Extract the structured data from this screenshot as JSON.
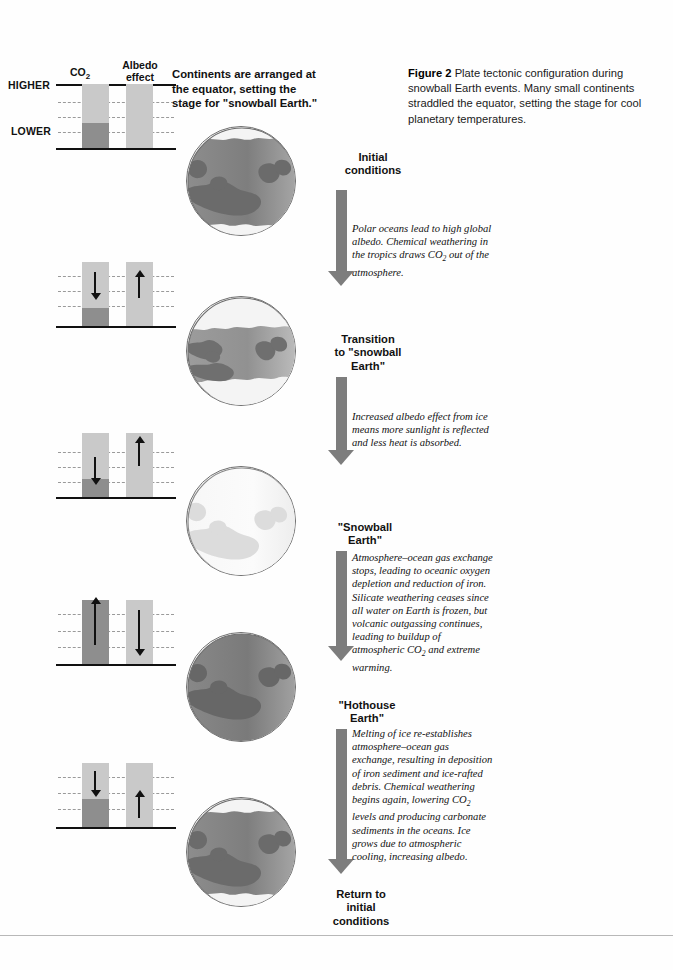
{
  "caption": {
    "label": "Figure 2",
    "text": "Plate tectonic configuration during snowball Earth events. Many small continents straddled the equator, setting the stage for cool planetary temperatures."
  },
  "legend": {
    "co2_header": "CO",
    "co2_sub": "2",
    "albedo_header_line1": "Albedo",
    "albedo_header_line2": "effect",
    "higher_label": "HIGHER",
    "lower_label": "LOWER"
  },
  "intro_text": "Continents are arranged at the equator, setting the stage for \"snowball Earth.\"",
  "colors": {
    "bar_track": "#c9c9c9",
    "bar_fill": "#8e8e8e",
    "flow_arrow": "#7d7d7d",
    "ocean_warm": "#7f7f7f",
    "ocean_cold": "#9a9a9a",
    "continent": "#6b6b6b",
    "ice": "#f2f2f2",
    "outline": "#6f6f6f",
    "rule": "#111111"
  },
  "stages": [
    {
      "id": "initial",
      "label": "Initial\nconditions",
      "label_lines": [
        "Initial",
        "conditions"
      ],
      "globe_state": "warm-ocean-small-caps",
      "indicator": {
        "co2_level": "mid",
        "co2_fill_pct": 38,
        "albedo_level": "mid",
        "albedo_fill_pct": 0,
        "co2_arrow": "none",
        "albedo_arrow": "none"
      }
    },
    {
      "id": "transition",
      "label_lines": [
        "Transition",
        "to \"snowball",
        "Earth\""
      ],
      "globe_state": "large-polar-caps",
      "indicator": {
        "co2_level": "low",
        "co2_fill_pct": 27,
        "albedo_level": "high",
        "albedo_fill_pct": 0,
        "co2_arrow": "down",
        "albedo_arrow": "up"
      }
    },
    {
      "id": "snowball",
      "label_lines": [
        "\"Snowball",
        "Earth\""
      ],
      "globe_state": "fully-frozen",
      "indicator": {
        "co2_level": "low",
        "co2_fill_pct": 27,
        "albedo_level": "very-high",
        "albedo_fill_pct": 0,
        "co2_arrow": "down",
        "albedo_arrow": "up"
      }
    },
    {
      "id": "hothouse",
      "label_lines": [
        "\"Hothouse",
        "Earth\""
      ],
      "globe_state": "hot-no-ice",
      "indicator": {
        "co2_level": "very-high",
        "co2_fill_pct": 100,
        "albedo_level": "low",
        "albedo_fill_pct": 0,
        "co2_arrow": "up",
        "albedo_arrow": "down"
      }
    },
    {
      "id": "return",
      "label_lines": [
        "Return to",
        "initial",
        "conditions"
      ],
      "globe_state": "warm-ocean-small-caps",
      "indicator": {
        "co2_level": "mid",
        "co2_fill_pct": 44,
        "albedo_level": "mid",
        "albedo_fill_pct": 0,
        "co2_arrow": "down",
        "albedo_arrow": "up"
      }
    }
  ],
  "annotations": [
    {
      "id": "annot-1",
      "parts": [
        "Polar oceans lead to high global albedo. Chemical weathering in the tropics draws CO",
        "2",
        " out of the atmosphere."
      ]
    },
    {
      "id": "annot-2",
      "parts": [
        "Increased albedo effect from ice means more sunlight is reflected and less heat is absorbed.",
        "",
        ""
      ]
    },
    {
      "id": "annot-3",
      "parts": [
        "Atmosphere–ocean gas exchange stops, leading to oceanic oxygen depletion and reduction of iron. Silicate weathering ceases since all water on Earth is frozen, but volcanic outgassing continues, leading to buildup of atmospheric CO",
        "2",
        " and extreme warming."
      ]
    },
    {
      "id": "annot-4",
      "parts": [
        "Melting of ice re-establishes atmosphere–ocean gas exchange, resulting in deposition of iron sediment and ice-rafted debris. Chemical weathering begins again, lowering CO",
        "2",
        " levels and producing carbonate sediments in the oceans. Ice grows due to atmospheric cooling, increasing albedo."
      ]
    }
  ]
}
